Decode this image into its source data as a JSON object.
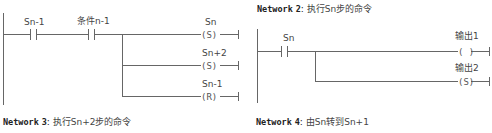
{
  "networks": [
    {
      "id": 1,
      "contacts": [
        {
          "label": "Sn-1"
        },
        {
          "label": "条件n-1"
        }
      ],
      "coils": [
        {
          "label": "Sn",
          "type": "S",
          "symbol": "(S)"
        },
        {
          "label": "Sn+2",
          "type": "S",
          "symbol": "(S)"
        },
        {
          "label": "Sn-1",
          "type": "R",
          "symbol": "(R)"
        }
      ]
    },
    {
      "id": 2,
      "keyword": "Network",
      "number": "2",
      "separator": ":",
      "description": "执行Sn步的命令",
      "contacts": [
        {
          "label": "Sn"
        }
      ],
      "coils": [
        {
          "label": "输出1",
          "type": "output",
          "symbol": "( )"
        },
        {
          "label": "输出2",
          "type": "S",
          "symbol": "(S)"
        }
      ]
    },
    {
      "id": 3,
      "keyword": "Network",
      "number": "3",
      "separator": ":",
      "description": "执行Sn+2步的命令"
    },
    {
      "id": 4,
      "keyword": "Network",
      "number": "4",
      "separator": ":",
      "description": "由Sn转到Sn+1"
    }
  ],
  "colors": {
    "line": "#555555",
    "text": "#444444",
    "background": "#ffffff"
  }
}
